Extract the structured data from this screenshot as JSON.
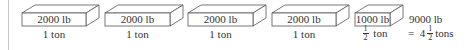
{
  "diagram": {
    "boxes": [
      {
        "weight": "2000 lb",
        "tons": "1 ton"
      },
      {
        "weight": "2000 lb",
        "tons": "1 ton"
      },
      {
        "weight": "2000 lb",
        "tons": "1 ton"
      },
      {
        "weight": "2000 lb",
        "tons": "1 ton"
      },
      {
        "weight": "1000 lb",
        "tons_num": "1",
        "tons_den": "2",
        "tons_unit": "ton"
      }
    ],
    "total": {
      "weight": "9000 lb",
      "equals": "=",
      "whole": "4",
      "frac_num": "1",
      "frac_den": "2",
      "unit": "tons"
    }
  }
}
